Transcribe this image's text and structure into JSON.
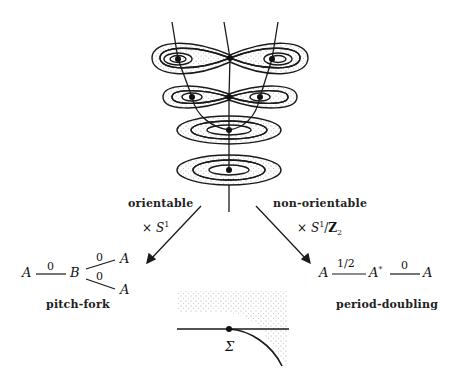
{
  "figure": {
    "left_branch": {
      "label": "orientable",
      "operation": {
        "prefix": "×",
        "symbol": "S",
        "superscript": "1"
      },
      "diagram": {
        "nodes": [
          "A",
          "B",
          "A",
          "A"
        ],
        "edge_labels": [
          "0",
          "0",
          "0"
        ]
      },
      "caption": "pitch-fork"
    },
    "right_branch": {
      "label": "non-orientable",
      "operation": {
        "prefix": "×",
        "symbol": "S",
        "superscript": "1",
        "slash": "/",
        "group": "Z",
        "subscript": "2"
      },
      "diagram": {
        "nodes": [
          "A",
          "A",
          "*",
          "A"
        ],
        "edge_labels": [
          "1/2",
          "0"
        ]
      },
      "caption": "period-doubling"
    },
    "bottom_inset": {
      "label": "Σ"
    },
    "colors": {
      "ink": "#1a1a1a",
      "background": "#ffffff",
      "stipple": "#555555"
    }
  }
}
